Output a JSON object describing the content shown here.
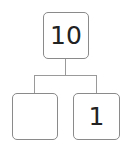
{
  "diagram": {
    "type": "number-bond",
    "whole": {
      "value": "10"
    },
    "parts": [
      {
        "value": ""
      },
      {
        "value": "1"
      }
    ],
    "colors": {
      "border": "#8a8a8a",
      "line": "#9a9a9a",
      "text": "#222222"
    }
  }
}
